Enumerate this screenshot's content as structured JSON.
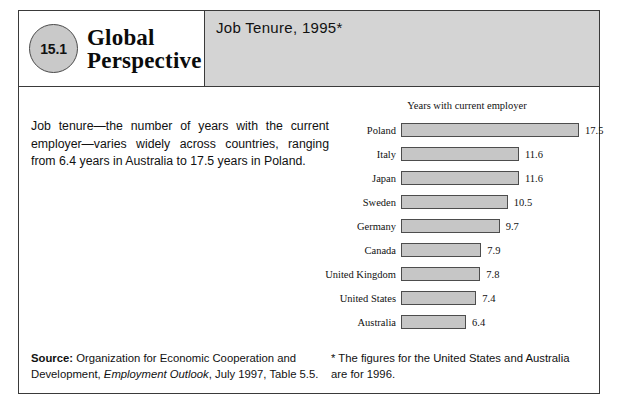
{
  "header": {
    "badge_number": "15.1",
    "series_title_line1": "Global",
    "series_title_line2": "Perspective",
    "case_title": "Job Tenure, 1995*",
    "panel_color": "#d4d4d4",
    "badge_color": "#c9c9c9"
  },
  "blurb": "Job tenure—the number of years with the current employer—varies widely across countries, ranging from 6.4 years in Australia to 17.5 years in Poland.",
  "chart_data": {
    "type": "bar",
    "orientation": "horizontal",
    "title": "Years with current employer",
    "xlabel": "",
    "ylabel": "",
    "xlim": [
      0,
      17.5
    ],
    "grid": false,
    "legend": "none",
    "bar_fill": "#c6c6c6",
    "bar_border": "#4d4d4d",
    "categories": [
      "Poland",
      "Italy",
      "Japan",
      "Sweden",
      "Germany",
      "Canada",
      "United Kingdom",
      "United States",
      "Australia"
    ],
    "values": [
      17.5,
      11.6,
      11.6,
      10.5,
      9.7,
      7.9,
      7.8,
      7.4,
      6.4
    ],
    "value_labels": [
      "17.5",
      "11.6",
      "11.6",
      "10.5",
      "9.7",
      "7.9",
      "7.8",
      "7.4",
      "6.4"
    ]
  },
  "footer": {
    "source_label": "Source:",
    "source_text_1": " Organization for Economic Cooperation and Development, ",
    "source_italic": "Employment Outlook",
    "source_text_2": ", July 1997, Table 5.5.",
    "footnote": "* The figures for the United States and Australia are for 1996."
  }
}
